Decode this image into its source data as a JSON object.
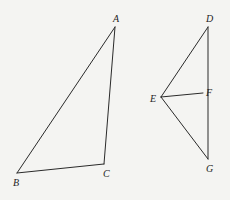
{
  "diagram": {
    "type": "geometry",
    "colors": {
      "background": "#f4f4f2",
      "stroke": "#2a2a2a",
      "label": "#1e1e1e"
    },
    "points": {
      "A": {
        "x": 115,
        "y": 27,
        "label": "A",
        "lx": 113,
        "ly": 22
      },
      "B": {
        "x": 17,
        "y": 173,
        "label": "B",
        "lx": 13,
        "ly": 186
      },
      "C": {
        "x": 104,
        "y": 164,
        "label": "C",
        "lx": 103,
        "ly": 177
      },
      "D": {
        "x": 208,
        "y": 27,
        "label": "D",
        "lx": 206,
        "ly": 22
      },
      "E": {
        "x": 161,
        "y": 97,
        "label": "E",
        "lx": 150,
        "ly": 102
      },
      "F": {
        "x": 203,
        "y": 93,
        "label": "F",
        "lx": 206,
        "ly": 96
      },
      "G": {
        "x": 208,
        "y": 159,
        "label": "G",
        "lx": 206,
        "ly": 172
      }
    },
    "segments": [
      [
        "A",
        "B"
      ],
      [
        "B",
        "C"
      ],
      [
        "C",
        "A"
      ],
      [
        "D",
        "E"
      ],
      [
        "E",
        "G"
      ],
      [
        "D",
        "G"
      ],
      [
        "E",
        "F"
      ]
    ],
    "labels": [
      "A",
      "B",
      "C",
      "D",
      "E",
      "F",
      "G"
    ]
  }
}
